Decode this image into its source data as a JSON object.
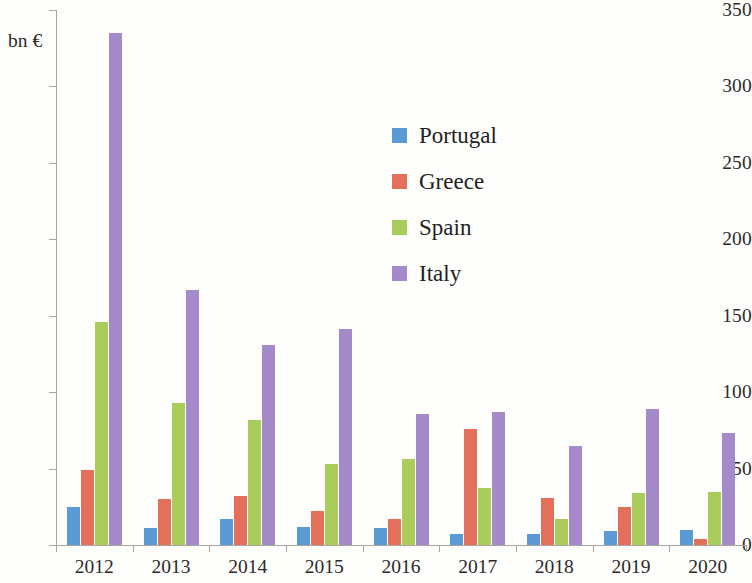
{
  "chart_data": {
    "type": "bar",
    "title": "",
    "subtitle": "",
    "xlabel": "",
    "ylabel": "bn €",
    "unit_caption": "bn €",
    "ylim": [
      0,
      350
    ],
    "ytick_step": 50,
    "yticks": [
      0,
      50,
      100,
      150,
      200,
      250,
      300,
      350
    ],
    "ytick_labels": [
      "0",
      "50",
      "100",
      "150",
      "200",
      "250",
      "300",
      "350"
    ],
    "grid": false,
    "legend_position": "inside-upper-center",
    "categories": [
      "2012",
      "2013",
      "2014",
      "2015",
      "2016",
      "2017",
      "2018",
      "2019",
      "2020"
    ],
    "series": [
      {
        "name": "Portugal",
        "color": "#5B9BD5",
        "values": [
          25,
          11,
          17,
          12,
          11,
          7,
          7,
          9,
          10
        ]
      },
      {
        "name": "Greece",
        "color": "#E2705A",
        "values": [
          49,
          30,
          32,
          22,
          17,
          76,
          31,
          25,
          4
        ]
      },
      {
        "name": "Spain",
        "color": "#A9CC5A",
        "values": [
          146,
          93,
          82,
          53,
          56,
          37,
          17,
          34,
          35
        ]
      },
      {
        "name": "Italy",
        "color": "#A48AC9",
        "values": [
          335,
          167,
          131,
          141,
          86,
          87,
          65,
          89,
          73
        ]
      }
    ]
  },
  "legend": {
    "items": [
      {
        "label": "Portugal",
        "color": "#5B9BD5"
      },
      {
        "label": "Greece",
        "color": "#E2705A"
      },
      {
        "label": "Spain",
        "color": "#A9CC5A"
      },
      {
        "label": "Italy",
        "color": "#A48AC9"
      }
    ]
  },
  "axes": {
    "unit_caption": "bn €"
  }
}
